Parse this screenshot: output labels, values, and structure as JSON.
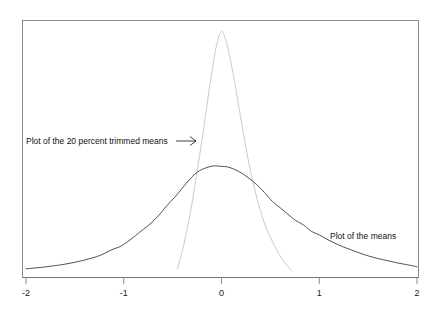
{
  "chart_data": {
    "type": "line",
    "title": "",
    "subtitle": "",
    "xlabel": "",
    "ylabel": "",
    "xlim": [
      -2,
      2
    ],
    "ylim": [
      0,
      1
    ],
    "grid": false,
    "legend_position": "inline-annotations",
    "axis": {
      "x_ticks": [
        -2,
        -1,
        0,
        1,
        2
      ],
      "x_tick_labels": [
        "-2",
        "-1",
        "0",
        "1",
        "2"
      ],
      "y_ticks": [],
      "y_tick_labels": []
    },
    "annotations": [
      {
        "name": "trimmed-means-annotation",
        "text": "Plot of the 20 percent trimmed means",
        "arrow": "→",
        "x": -1.95,
        "y": 0.52
      },
      {
        "name": "means-annotation",
        "text": "Plot of the means",
        "x": 1.15,
        "y": 0.17
      }
    ],
    "series": [
      {
        "name": "Plot of the means",
        "color": "#3d3d3d",
        "style": "solid",
        "x": [
          -2.0,
          -1.92,
          -1.84,
          -1.76,
          -1.68,
          -1.6,
          -1.52,
          -1.44,
          -1.36,
          -1.28,
          -1.2,
          -1.12,
          -1.04,
          -0.96,
          -0.88,
          -0.8,
          -0.72,
          -0.64,
          -0.56,
          -0.48,
          -0.4,
          -0.32,
          -0.24,
          -0.16,
          -0.08,
          0.0,
          0.06,
          0.12,
          0.2,
          0.28,
          0.36,
          0.44,
          0.52,
          0.6,
          0.68,
          0.76,
          0.84,
          0.92,
          1.0,
          1.08,
          1.16,
          1.24,
          1.32,
          1.4,
          1.48,
          1.56,
          1.64,
          1.72,
          1.8,
          1.88,
          1.96,
          2.0
        ],
        "y": [
          0.03,
          0.033,
          0.036,
          0.04,
          0.044,
          0.049,
          0.055,
          0.062,
          0.07,
          0.079,
          0.092,
          0.108,
          0.12,
          0.14,
          0.165,
          0.19,
          0.216,
          0.248,
          0.286,
          0.32,
          0.358,
          0.396,
          0.425,
          0.44,
          0.448,
          0.446,
          0.444,
          0.436,
          0.42,
          0.398,
          0.372,
          0.34,
          0.304,
          0.278,
          0.252,
          0.226,
          0.208,
          0.182,
          0.168,
          0.15,
          0.134,
          0.12,
          0.108,
          0.096,
          0.085,
          0.076,
          0.068,
          0.061,
          0.054,
          0.048,
          0.042,
          0.038
        ]
      },
      {
        "name": "Plot of the 20 percent trimmed means",
        "color": "#c9c9c9",
        "style": "solid-light",
        "x": [
          -0.45,
          -0.42,
          -0.39,
          -0.36,
          -0.33,
          -0.3,
          -0.27,
          -0.24,
          -0.21,
          -0.18,
          -0.15,
          -0.12,
          -0.09,
          -0.06,
          -0.03,
          0.0,
          0.02,
          0.05,
          0.08,
          0.11,
          0.14,
          0.17,
          0.2,
          0.24,
          0.28,
          0.32,
          0.38,
          0.44,
          0.5,
          0.56,
          0.62,
          0.68,
          0.72
        ],
        "y": [
          0.03,
          0.075,
          0.12,
          0.175,
          0.235,
          0.3,
          0.375,
          0.45,
          0.525,
          0.605,
          0.69,
          0.775,
          0.85,
          0.92,
          0.97,
          0.995,
          0.985,
          0.95,
          0.9,
          0.84,
          0.775,
          0.705,
          0.635,
          0.545,
          0.46,
          0.385,
          0.29,
          0.215,
          0.158,
          0.11,
          0.07,
          0.038,
          0.022
        ]
      }
    ]
  }
}
